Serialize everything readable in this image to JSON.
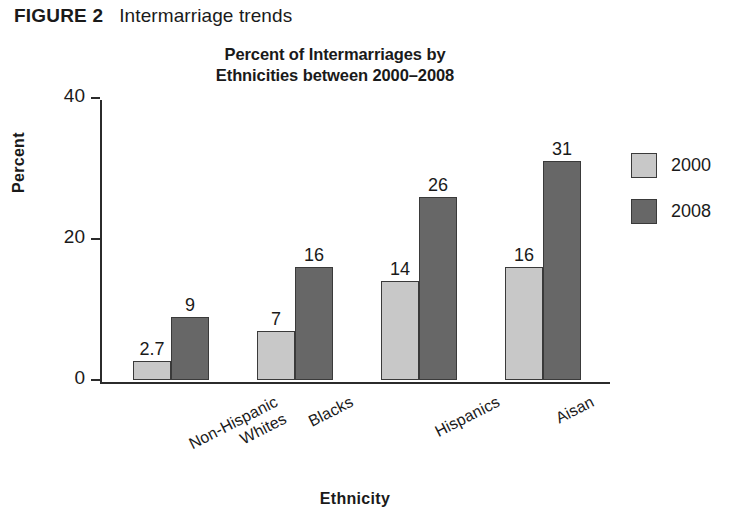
{
  "figure": {
    "label": "FIGURE 2",
    "caption": "Intermarriage trends"
  },
  "colors": {
    "series_2000": "#c8c8c8",
    "series_2008": "#676767",
    "bar_outline": "#3a3a3a",
    "axis": "#2b2b2b",
    "text": "#1a1a1a",
    "background": "#ffffff"
  },
  "chart_data": {
    "type": "bar",
    "title": "Percent of Intermarriages by Ethnicities between 2000–2008",
    "title_line1": "Percent of Intermarriages by",
    "title_line2": "Ethnicities between 2000–2008",
    "xlabel": "Ethnicity",
    "ylabel": "Percent",
    "ylim": [
      0,
      40
    ],
    "yticks": [
      0,
      20,
      40
    ],
    "ytick_labels": [
      "0",
      "20",
      "40"
    ],
    "grid": false,
    "legend_position": "right",
    "categories": [
      "Non-Hispanic Whites",
      "Blacks",
      "Hispanics",
      "Aisan"
    ],
    "category_lines": [
      [
        "Non-Hispanic",
        "Whites"
      ],
      [
        "Blacks"
      ],
      [
        "Hispanics"
      ],
      [
        "Aisan"
      ]
    ],
    "series": [
      {
        "name": "2000",
        "color": "#c8c8c8",
        "values": [
          2.7,
          7,
          14,
          16
        ],
        "labels": [
          "2.7",
          "7",
          "14",
          "16"
        ]
      },
      {
        "name": "2008",
        "color": "#676767",
        "values": [
          9,
          16,
          26,
          31
        ],
        "labels": [
          "9",
          "16",
          "26",
          "31"
        ]
      }
    ]
  }
}
